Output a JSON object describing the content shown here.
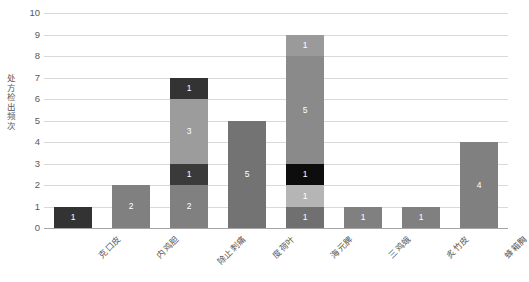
{
  "chart_data": {
    "type": "bar",
    "subtype": "stacked-bar",
    "title": "",
    "xlabel": "",
    "ylabel": "处方检出频次",
    "ylim": [
      0,
      10
    ],
    "yticks": [
      0,
      1,
      2,
      3,
      4,
      5,
      6,
      7,
      8,
      9,
      10
    ],
    "grid": true,
    "legend": "none",
    "categories": [
      "克口皮",
      "内鸡胆",
      "除止刺痛",
      "度荷叶",
      "海元脾",
      "三鸡蛾",
      "炙竹皮",
      "蜂箱胸"
    ],
    "totals": [
      1,
      2,
      7,
      5,
      9,
      1,
      1,
      4
    ],
    "stacks": [
      {
        "category": "克口皮",
        "segments": [
          {
            "value": 1,
            "label": "1",
            "color": "#333333"
          }
        ]
      },
      {
        "category": "内鸡胆",
        "segments": [
          {
            "value": 2,
            "label": "2",
            "color": "#808080"
          }
        ]
      },
      {
        "category": "除止刺痛",
        "segments": [
          {
            "value": 2,
            "label": "2",
            "color": "#808080"
          },
          {
            "value": 1,
            "label": "1",
            "color": "#3a3a3a"
          },
          {
            "value": 3,
            "label": "3",
            "color": "#9c9c9c"
          },
          {
            "value": 1,
            "label": "1",
            "color": "#333333"
          }
        ]
      },
      {
        "category": "度荷叶",
        "segments": [
          {
            "value": 5,
            "label": "5",
            "color": "#737373"
          }
        ]
      },
      {
        "category": "海元脾",
        "segments": [
          {
            "value": 1,
            "label": "1",
            "color": "#707070"
          },
          {
            "value": 1,
            "label": "1",
            "color": "#b5b5b5"
          },
          {
            "value": 1,
            "label": "1",
            "color": "#0d0d0d"
          },
          {
            "value": 5,
            "label": "5",
            "color": "#8a8a8a"
          },
          {
            "value": 1,
            "label": "1",
            "color": "#9a9a9a"
          }
        ]
      },
      {
        "category": "三鸡蛾",
        "segments": [
          {
            "value": 1,
            "label": "1",
            "color": "#808080"
          }
        ]
      },
      {
        "category": "炙竹皮",
        "segments": [
          {
            "value": 1,
            "label": "1",
            "color": "#808080"
          }
        ]
      },
      {
        "category": "蜂箱胸",
        "segments": [
          {
            "value": 4,
            "label": "4",
            "color": "#808080"
          }
        ]
      }
    ],
    "colors": {
      "gridline": "#d9d9d9",
      "axis": "#a6a6a6",
      "tick_text": "#595959",
      "data_label": "#ffffff",
      "background": "#ffffff"
    }
  }
}
